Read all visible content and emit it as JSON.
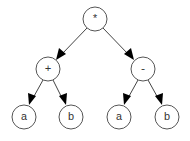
{
  "diagram": {
    "type": "expression-tree",
    "nodes": [
      {
        "id": "root",
        "label": "*",
        "x": 95,
        "y": 19
      },
      {
        "id": "plus",
        "label": "+",
        "x": 48,
        "y": 69
      },
      {
        "id": "minus",
        "label": "-",
        "x": 143,
        "y": 69
      },
      {
        "id": "a1",
        "label": "a",
        "x": 24,
        "y": 117
      },
      {
        "id": "b1",
        "label": "b",
        "x": 71,
        "y": 117
      },
      {
        "id": "a2",
        "label": "a",
        "x": 119,
        "y": 117
      },
      {
        "id": "b2",
        "label": "b",
        "x": 167,
        "y": 117
      }
    ],
    "edges": [
      {
        "from": "root",
        "to": "plus"
      },
      {
        "from": "root",
        "to": "minus"
      },
      {
        "from": "plus",
        "to": "a1"
      },
      {
        "from": "plus",
        "to": "b1"
      },
      {
        "from": "minus",
        "to": "a2"
      },
      {
        "from": "minus",
        "to": "b2"
      }
    ],
    "node_radius": 12
  }
}
